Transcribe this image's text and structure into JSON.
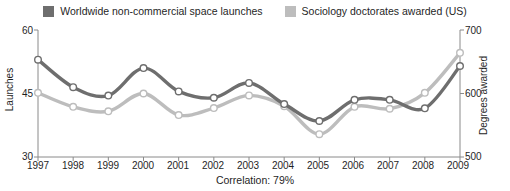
{
  "legend": {
    "entries": [
      {
        "label": "Worldwide non-commercial space launches",
        "color": "#6e6e6e",
        "icon": "legend-swatch-icon"
      },
      {
        "label": "Sociology doctorates awarded (US)",
        "color": "#bdbdbd",
        "icon": "legend-swatch-icon"
      }
    ]
  },
  "caption": {
    "correlation": "Correlation: 79%"
  },
  "axes": {
    "left": {
      "title": "Launches",
      "ticks": [
        "60",
        "45",
        "30"
      ]
    },
    "right": {
      "title": "Degrees awarded",
      "ticks": [
        "700",
        "600",
        "500"
      ]
    }
  },
  "chart_data": {
    "type": "line",
    "title": "",
    "subtitle": "",
    "xlabel": "",
    "ylabel": "Launches",
    "y2label": "Degrees awarded",
    "grid": false,
    "legend_position": "top-center",
    "annotations": [
      "Correlation: 79%"
    ],
    "x": [
      1997,
      1998,
      1999,
      2000,
      2001,
      2002,
      2003,
      2004,
      2005,
      2006,
      2007,
      2008,
      2009
    ],
    "categories": [
      "1997",
      "1998",
      "1999",
      "2000",
      "2001",
      "2002",
      "2003",
      "2004",
      "2005",
      "2006",
      "2007",
      "2008",
      "2009"
    ],
    "ylim": [
      30,
      60
    ],
    "yticks": [
      30,
      45,
      60
    ],
    "y2lim": [
      500,
      700
    ],
    "y2ticks": [
      500,
      600,
      700
    ],
    "series": [
      {
        "name": "Worldwide non-commercial space launches",
        "axis": "left",
        "color": "#6e6e6e",
        "marker": "circle",
        "values": [
          53,
          46.5,
          44.5,
          51,
          45.5,
          44,
          47.5,
          42.5,
          38.5,
          43.5,
          43.5,
          41.5,
          51.5
        ]
      },
      {
        "name": "Sociology doctorates awarded (US)",
        "axis": "right",
        "color": "#bdbdbd",
        "marker": "circle",
        "values": [
          601,
          579,
          572,
          600,
          566,
          577,
          597,
          580,
          536,
          579,
          576,
          601,
          664
        ]
      }
    ]
  }
}
